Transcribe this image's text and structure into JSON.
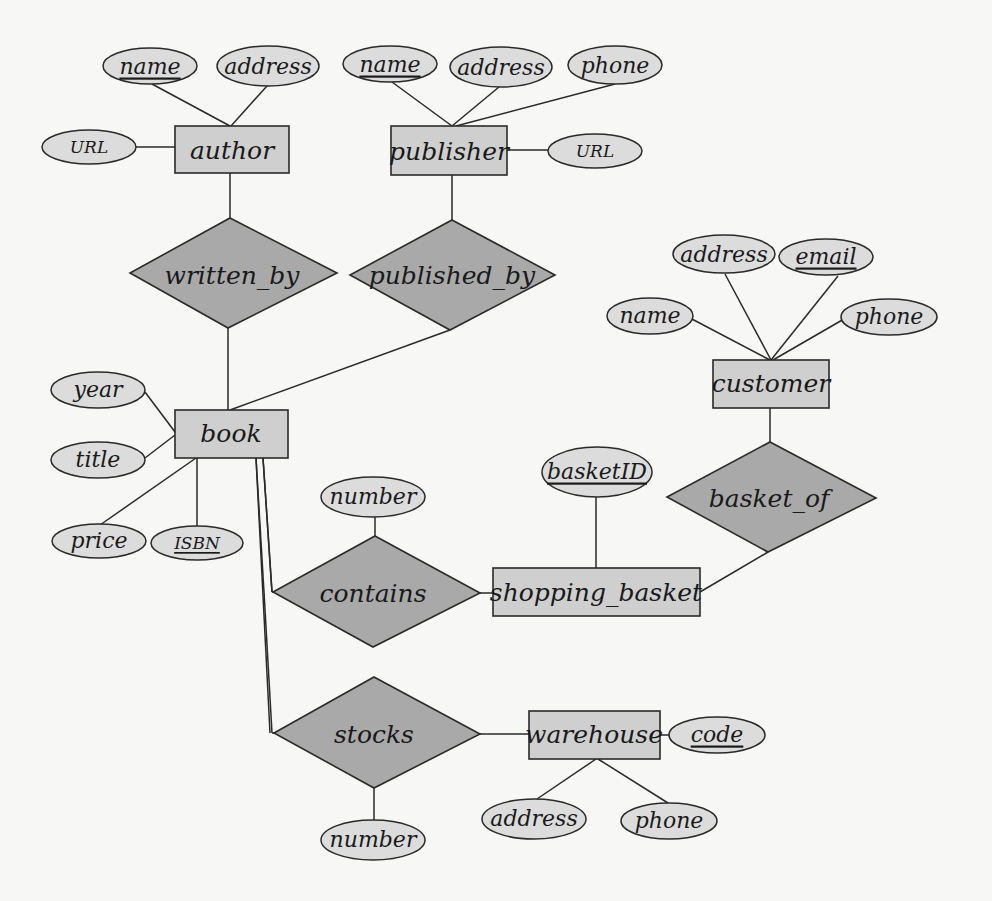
{
  "diagram": {
    "type": "entity-relationship",
    "colors": {
      "entity_fill": "#cfcfcf",
      "relationship_fill": "#a9a9a9",
      "attribute_fill": "#dcdcdc",
      "stroke": "#2a2a2a",
      "background": "#f7f7f5"
    },
    "entities": {
      "author": {
        "label": "author",
        "attributes": {
          "name": "name",
          "address": "address",
          "url": "URL"
        },
        "key": "name"
      },
      "publisher": {
        "label": "publisher",
        "attributes": {
          "name": "name",
          "address": "address",
          "phone": "phone",
          "url": "URL"
        },
        "key": "name"
      },
      "book": {
        "label": "book",
        "attributes": {
          "year": "year",
          "title": "title",
          "price": "price",
          "isbn": "ISBN"
        },
        "key": "ISBN"
      },
      "customer": {
        "label": "customer",
        "attributes": {
          "address": "address",
          "email": "email",
          "name": "name",
          "phone": "phone"
        },
        "key": "email"
      },
      "shopping_basket": {
        "label": "shopping_basket",
        "attributes": {
          "basketid": "basketID"
        },
        "key": "basketID"
      },
      "warehouse": {
        "label": "warehouse",
        "attributes": {
          "code": "code",
          "address": "address",
          "phone": "phone"
        },
        "key": "code"
      }
    },
    "relationships": {
      "written_by": {
        "label": "written_by",
        "connects": [
          "author",
          "book"
        ]
      },
      "published_by": {
        "label": "published_by",
        "connects": [
          "publisher",
          "book"
        ]
      },
      "basket_of": {
        "label": "basket_of",
        "connects": [
          "customer",
          "shopping_basket"
        ]
      },
      "contains": {
        "label": "contains",
        "connects": [
          "book",
          "shopping_basket"
        ],
        "attributes": {
          "number": "number"
        },
        "total_participation": "book"
      },
      "stocks": {
        "label": "stocks",
        "connects": [
          "book",
          "warehouse"
        ],
        "attributes": {
          "number": "number"
        },
        "total_participation": "book"
      }
    }
  }
}
